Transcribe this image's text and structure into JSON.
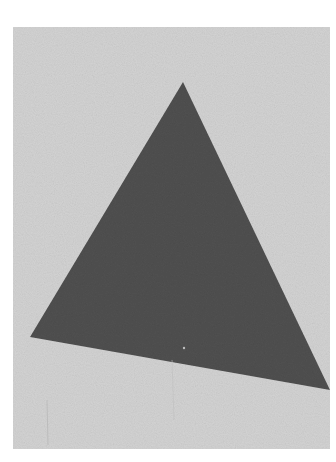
{
  "image": {
    "subject": "dark gray triangle on speckled light gray paper",
    "canvas": {
      "width": 336,
      "height": 462,
      "background": "#ffffff"
    },
    "panel": {
      "x": 13,
      "y": 27,
      "width": 317,
      "height": 422,
      "color": "#d3d3d3"
    },
    "triangle": {
      "color": "#505050",
      "vertices": [
        [
          183,
          82
        ],
        [
          30,
          337
        ],
        [
          330,
          390
        ]
      ]
    }
  }
}
